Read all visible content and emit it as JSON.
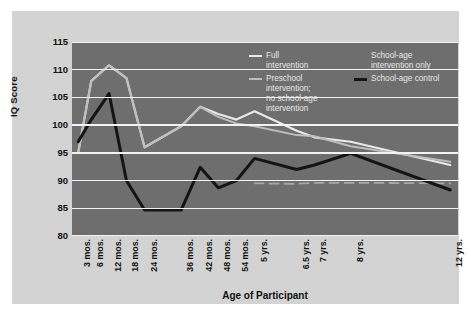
{
  "chart_data": {
    "type": "line",
    "title": "",
    "xlabel": "Age of Participant",
    "ylabel": "IQ Score",
    "ylim": [
      80,
      115
    ],
    "yticks": [
      80,
      85,
      90,
      95,
      100,
      105,
      110,
      115
    ],
    "grid": true,
    "legend_position": "inside-top-right",
    "categories": [
      "3 mos.",
      "6 mos.",
      "12 mos.",
      "18 mos.",
      "24 mos.",
      "36 mos.",
      "42 mos.",
      "48 mos.",
      "54 mos.",
      "5 yrs.",
      "6.5 yrs.",
      "7 yrs.",
      "8 yrs.",
      "12 yrs."
    ],
    "series": [
      {
        "name": "Full intervention",
        "color": "#e9e9e9",
        "style": "solid",
        "width": 2.2,
        "values": [
          95.0,
          108.0,
          110.8,
          108.5,
          96.0,
          99.8,
          103.3,
          102.0,
          101.0,
          102.5,
          99.0,
          97.8,
          97.0,
          92.8
        ]
      },
      {
        "name": "Preschool intervention; no school-age intervention",
        "color": "#bdbdbd",
        "style": "solid",
        "width": 2.0,
        "values": [
          95.0,
          108.0,
          110.8,
          108.5,
          96.0,
          99.8,
          103.3,
          101.5,
          100.3,
          99.8,
          98.2,
          98.0,
          96.2,
          93.4
        ]
      },
      {
        "name": "School-age intervention only",
        "color": "#a8a8a8",
        "style": "dashed",
        "width": 1.8,
        "values": [
          null,
          null,
          null,
          null,
          null,
          null,
          null,
          null,
          null,
          89.5,
          89.4,
          89.6,
          89.6,
          89.5
        ]
      },
      {
        "name": "School-age control",
        "color": "#141414",
        "style": "solid",
        "width": 3.0,
        "values": [
          97.0,
          101.0,
          105.7,
          90.0,
          84.7,
          84.7,
          92.4,
          88.7,
          90.0,
          94.0,
          92.0,
          92.8,
          94.9,
          88.3
        ]
      }
    ],
    "legend": {
      "left_column": [
        {
          "label_lines": [
            "Full",
            "intervention"
          ],
          "color": "#e9e9e9",
          "thick": false
        },
        {
          "label_lines": [
            "Preschool",
            "intervention;",
            "no school-age",
            "intervention"
          ],
          "color": "#bdbdbd",
          "thick": false
        }
      ],
      "right_column": [
        {
          "label_lines": [
            "School-age",
            "intervention only"
          ],
          "color": "#a8a8a8",
          "thick": false,
          "hide_swatch": true
        },
        {
          "label_lines": [
            "School-age control"
          ],
          "color": "#141414",
          "thick": true
        }
      ]
    }
  },
  "colors": {
    "page_background": "#ffffff",
    "card_background": "#d3d3d3",
    "plot_background": "#6e6e6e",
    "gridline": "#f2f2f2",
    "axis_text": "#111111",
    "legend_text": "#e8e8e8"
  }
}
